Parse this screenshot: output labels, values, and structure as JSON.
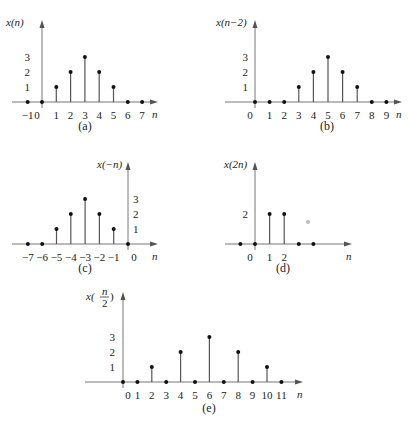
{
  "chart_data": [
    {
      "id": "a",
      "type": "stem",
      "caption": "(a)",
      "ylabel": "x(n)",
      "xlabel": "n",
      "x": [
        -1,
        0,
        1,
        2,
        3,
        4,
        5,
        6,
        7
      ],
      "values": [
        0,
        0,
        1,
        2,
        3,
        2,
        1,
        0,
        0
      ],
      "xtick_labels": [
        "-1",
        "0",
        "1",
        "2",
        "3",
        "4",
        "5",
        "6",
        "7"
      ],
      "ytick_labels": [
        "1",
        "2",
        "3"
      ],
      "layout": {
        "x0": 42,
        "y0": 102,
        "dx": 14.3,
        "dy": 15,
        "xmin_px": 12,
        "xmax_px": 158,
        "ytop_px": 20,
        "ylab_x": 6,
        "ylab_y": 26,
        "ytick_x": 30,
        "ytick_side": "left",
        "cap_x": 85,
        "cap_y": 130
      }
    },
    {
      "id": "b",
      "type": "stem",
      "caption": "(b)",
      "ylabel": "x(n−2)",
      "xlabel": "n",
      "x": [
        0,
        1,
        2,
        3,
        4,
        5,
        6,
        7,
        8,
        9
      ],
      "values": [
        0,
        0,
        0,
        1,
        2,
        3,
        2,
        1,
        0,
        0
      ],
      "xtick_labels": [
        "0",
        "1",
        "2",
        "3",
        "4",
        "5",
        "6",
        "7",
        "8",
        "9"
      ],
      "ytick_labels": [
        "1",
        "2",
        "3"
      ],
      "layout": {
        "x0": 255,
        "y0": 102,
        "dx": 14.6,
        "dy": 15,
        "xmin_px": 225,
        "xmax_px": 402,
        "ytop_px": 20,
        "ylab_x": 216,
        "ylab_y": 26,
        "ytick_x": 248,
        "ytick_side": "left",
        "cap_x": 327,
        "cap_y": 130
      }
    },
    {
      "id": "c",
      "type": "stem",
      "caption": "(c)",
      "ylabel": "x(−n)",
      "xlabel": "n",
      "x": [
        -7,
        -6,
        -5,
        -4,
        -3,
        -2,
        -1,
        0
      ],
      "values": [
        0,
        0,
        1,
        2,
        3,
        2,
        1,
        0
      ],
      "xtick_labels": [
        "-7",
        "-6",
        "-5",
        "-4",
        "-3",
        "-2",
        "-1",
        "0"
      ],
      "ytick_labels": [
        "1",
        "2",
        "3"
      ],
      "layout": {
        "x0": 128,
        "y0": 244,
        "dx": 14.3,
        "dy": 15,
        "xmin_px": 12,
        "xmax_px": 158,
        "ytop_px": 162,
        "ylab_x": 97,
        "ylab_y": 168,
        "ytick_x": 133,
        "ytick_side": "right",
        "cap_x": 85,
        "cap_y": 272
      }
    },
    {
      "id": "d",
      "type": "stem",
      "caption": "(d)",
      "ylabel": "x(2n)",
      "xlabel": "n",
      "x": [
        -1,
        0,
        1,
        2,
        3,
        4
      ],
      "values": [
        0,
        0,
        2,
        2,
        0,
        0
      ],
      "xtick_labels": [
        "",
        "0",
        "1",
        "2",
        "",
        ""
      ],
      "ytick_labels": [
        "",
        "2",
        ""
      ],
      "layout": {
        "x0": 255,
        "y0": 244,
        "dx": 14.6,
        "dy": 15,
        "xmin_px": 225,
        "xmax_px": 352,
        "ytop_px": 162,
        "ylab_x": 224,
        "ylab_y": 168,
        "ytick_x": 248,
        "ytick_side": "left",
        "cap_x": 283,
        "cap_y": 272
      }
    },
    {
      "id": "e",
      "type": "stem",
      "caption": "(e)",
      "ylabel": "x(n/2)",
      "xlabel": "n",
      "x": [
        0,
        1,
        2,
        3,
        4,
        5,
        6,
        7,
        8,
        9,
        10,
        11
      ],
      "values": [
        0,
        0,
        1,
        0,
        2,
        0,
        3,
        0,
        2,
        0,
        1,
        0
      ],
      "xtick_labels": [
        "0",
        "1",
        "2",
        "3",
        "4",
        "5",
        "6",
        "7",
        "8",
        "9",
        "10",
        "11"
      ],
      "ytick_labels": [
        "1",
        "2",
        "3"
      ],
      "layout": {
        "x0": 123,
        "y0": 382,
        "dx": 14.4,
        "dy": 15,
        "xmin_px": 85,
        "xmax_px": 303,
        "ytop_px": 292,
        "ylab_x": 86,
        "ylab_y": 300,
        "ytick_x": 115,
        "ytick_side": "left",
        "cap_x": 209,
        "cap_y": 412
      }
    }
  ],
  "stray_mark": {
    "x": 308,
    "y": 222
  }
}
